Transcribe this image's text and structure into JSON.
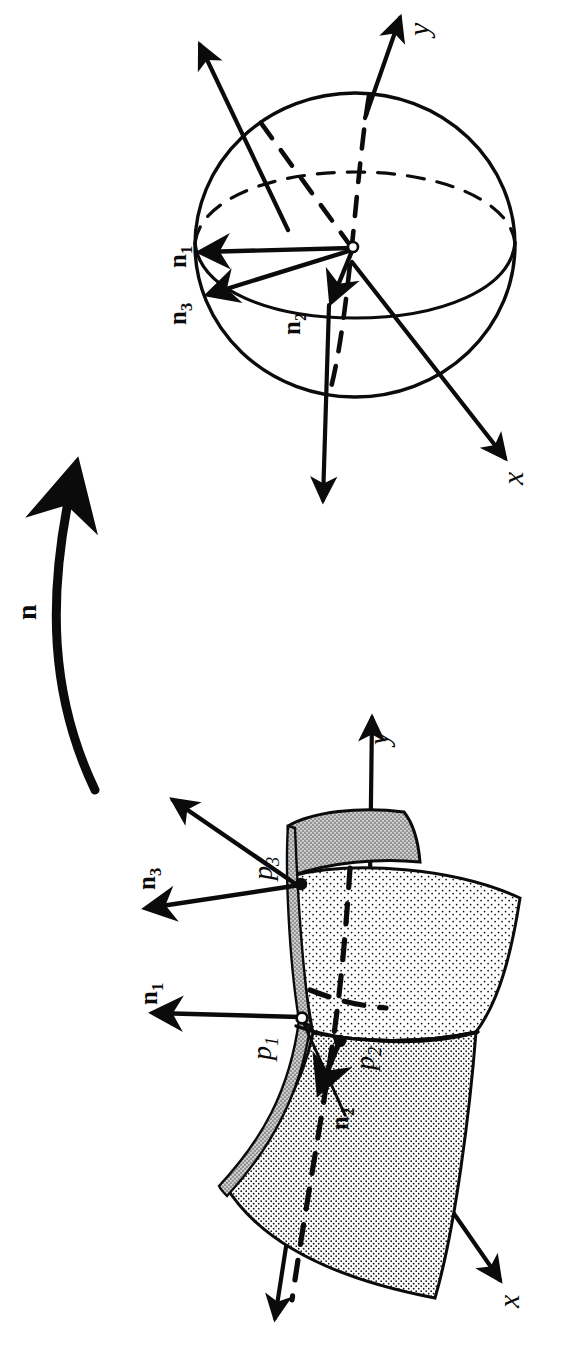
{
  "figure": {
    "background_color": "#ffffff",
    "ink_color": "#0b0b0b",
    "orientation_note": "All text is rotated 90 degrees counter-clockwise relative to the page",
    "map_arrow": {
      "label": "n",
      "style": "bold",
      "description": "curved arrow pointing from the surface panel to the sphere panel"
    },
    "panels": [
      {
        "id": "sphere-panel",
        "name": "unit-sphere-gauss-image",
        "axes": [
          {
            "name": "y",
            "label": "y",
            "style": "italic"
          },
          {
            "name": "x",
            "label": "x",
            "style": "italic"
          }
        ],
        "vectors": [
          {
            "name": "n1",
            "label": "n",
            "subscript": "1",
            "style": "bold"
          },
          {
            "name": "n2",
            "label": "n",
            "subscript": "2",
            "style": "bold"
          },
          {
            "name": "n3",
            "label": "n",
            "subscript": "3",
            "style": "bold"
          }
        ],
        "center_marker": "open-circle"
      },
      {
        "id": "surface-panel",
        "name": "saddle-surface",
        "axes": [
          {
            "name": "y",
            "label": "y",
            "style": "italic"
          },
          {
            "name": "x",
            "label": "x",
            "style": "italic"
          }
        ],
        "points": [
          {
            "name": "p1",
            "label": "p",
            "subscript": "1",
            "style": "italic",
            "marker": "open-circle"
          },
          {
            "name": "p2",
            "label": "p",
            "subscript": "2",
            "style": "italic",
            "marker": "filled-circle"
          },
          {
            "name": "p3",
            "label": "p",
            "subscript": "3",
            "style": "italic",
            "marker": "filled-circle"
          }
        ],
        "normals": [
          {
            "name": "n1",
            "label": "n",
            "subscript": "1",
            "style": "bold"
          },
          {
            "name": "n2",
            "label": "n",
            "subscript": "2",
            "style": "bold"
          },
          {
            "name": "n3",
            "label": "n",
            "subscript": "3",
            "style": "bold"
          }
        ],
        "shading": "stipple-dots"
      }
    ]
  }
}
